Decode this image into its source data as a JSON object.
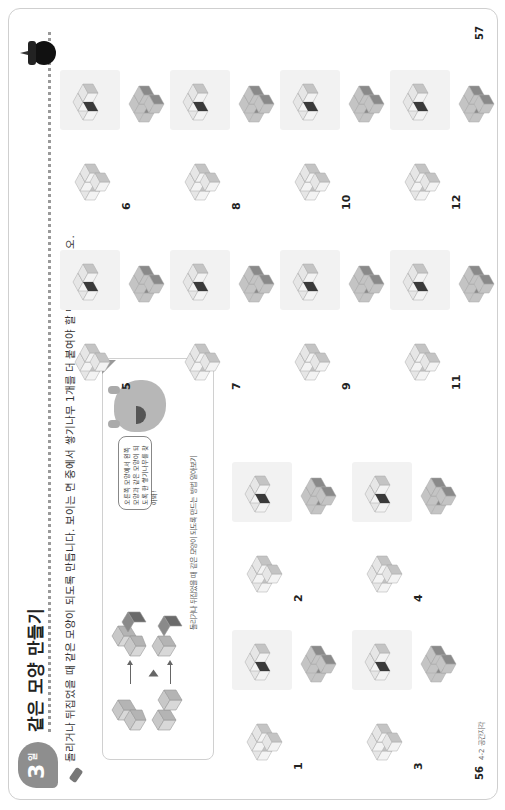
{
  "header": {
    "badge_number": "3",
    "badge_unit": "일",
    "title": "같은 모양 만들기",
    "instruction": "돌리거나 뒤집었을 때 같은 모양이 되도록 만듭니다. 보이는 면 중에서 쌓기나무 1개를 더 붙여야 할 면에 색칠하시오."
  },
  "example": {
    "caption": "돌리거나 뒤집었을 때 같은 모양이 되도록 만드는 방법 알아보기",
    "speech_bubble": "오른쪽 모양에서 왼쪽 모양과 같은 모양이 되도록 한 쌓기나무를 찾아봐!"
  },
  "questions": [
    {
      "number": "1"
    },
    {
      "number": "2"
    },
    {
      "number": "3"
    },
    {
      "number": "4"
    },
    {
      "number": "5"
    },
    {
      "number": "6"
    },
    {
      "number": "7"
    },
    {
      "number": "8"
    },
    {
      "number": "9"
    },
    {
      "number": "10"
    },
    {
      "number": "11"
    },
    {
      "number": "12"
    }
  ],
  "footer": {
    "left_page": "56",
    "left_label": "4-2 공간지각",
    "right_page": "57"
  },
  "colors": {
    "badge": "#8e8e8e",
    "light_cube": "#e6e6e6",
    "mid_cube": "#c4c4c4",
    "dark_cube": "#8a8a8a",
    "marked_face": "#3a3a3a"
  }
}
